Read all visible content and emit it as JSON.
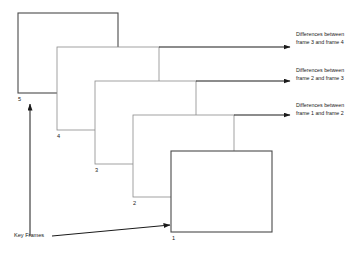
{
  "diagram": {
    "type": "cascading-key-frames-diagram",
    "background_color": "#ffffff",
    "line_color": "#1a1a1a",
    "frames": [
      {
        "id": "frame-5",
        "label": "5",
        "x": 18,
        "y": 13,
        "width": 100,
        "height": 80,
        "stroke": "#4a4a4a",
        "stroke_width": 1.1,
        "label_x": 18,
        "label_y": 101
      },
      {
        "id": "frame-4",
        "label": "4",
        "x": 57,
        "y": 47,
        "width": 102,
        "height": 83,
        "stroke": "#8a8a8a",
        "stroke_width": 0.8,
        "label_x": 57,
        "label_y": 138
      },
      {
        "id": "frame-3",
        "label": "3",
        "x": 95,
        "y": 81,
        "width": 101,
        "height": 83,
        "stroke": "#8a8a8a",
        "stroke_width": 0.8,
        "label_x": 95,
        "label_y": 172
      },
      {
        "id": "frame-2",
        "label": "2",
        "x": 133,
        "y": 115,
        "width": 101,
        "height": 82,
        "stroke": "#8a8a8a",
        "stroke_width": 0.8,
        "label_x": 133,
        "label_y": 205
      },
      {
        "id": "frame-1",
        "label": "1",
        "x": 171,
        "y": 151,
        "width": 101,
        "height": 81,
        "stroke": "#4a4a4a",
        "stroke_width": 1.1,
        "label_x": 172,
        "label_y": 240
      }
    ],
    "annotations": [
      {
        "id": "diff-3-4",
        "line1": "Differences between",
        "line2": "frame 3 and frame 4",
        "text_x": 296,
        "text_y": 36,
        "arrow_from_x": 159,
        "arrow_to_x": 290,
        "arrow_y": 47
      },
      {
        "id": "diff-2-3",
        "line1": "Differences between",
        "line2": "frame 2 and frame 3",
        "text_x": 296,
        "text_y": 72,
        "arrow_from_x": 196,
        "arrow_to_x": 290,
        "arrow_y": 81
      },
      {
        "id": "diff-1-2",
        "line1": "Differences between",
        "line2": "frame 1 and frame 2",
        "text_x": 296,
        "text_y": 107,
        "arrow_from_x": 234,
        "arrow_to_x": 290,
        "arrow_y": 115
      }
    ],
    "key_frames_annotation": {
      "label": "Key Frames",
      "text_x": 14,
      "text_y": 237,
      "vertical_arrow": {
        "from_x": 30,
        "from_y": 236,
        "to_x": 30,
        "to_y": 104
      },
      "diagonal_arrow": {
        "from_x": 52,
        "from_y": 236,
        "to_x": 170,
        "to_y": 225
      }
    }
  }
}
